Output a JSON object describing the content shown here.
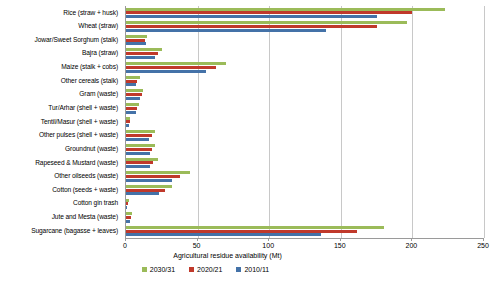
{
  "chart_data": {
    "type": "bar",
    "orientation": "horizontal",
    "title": "",
    "xlabel": "Agricultural residue availability (Mt)",
    "ylabel": "",
    "xlim": [
      0,
      250
    ],
    "xticks": [
      0,
      50,
      100,
      150,
      200,
      250
    ],
    "grid": true,
    "legend_position": "bottom",
    "categories": [
      "Rice (straw + husk)",
      "Wheat (straw)",
      "Jowar/Sweet Sorghum (stalk)",
      "Bajra (straw)",
      "Maize (stalk + cobs)",
      "Other cereals (stalk)",
      "Gram (waste)",
      "Tur/Arhar (shell + waste)",
      "Tentil/Masur (shell + waste)",
      "Other pulses (shell + waste)",
      "Groundnut (waste)",
      "Rapeseed & Mustard (waste)",
      "Other oilseeds (waste)",
      "Cotton (seeds + waste)",
      "Cotton gin trash",
      "Jute and Mesta (waste)",
      "Sugarcane (bagasse + leaves)"
    ],
    "series": [
      {
        "name": "2030/31",
        "color": "#9BBB59",
        "values": [
          223,
          196,
          15,
          25,
          70,
          10,
          12,
          9,
          3,
          20,
          20,
          22,
          45,
          32,
          2,
          4,
          180
        ]
      },
      {
        "name": "2020/21",
        "color": "#C0392B",
        "values": [
          200,
          175,
          13,
          22,
          63,
          8,
          11,
          8,
          2.5,
          18,
          18,
          19,
          38,
          27,
          1.5,
          3.5,
          161
        ]
      },
      {
        "name": "2010/11",
        "color": "#4472A8",
        "values": [
          175,
          140,
          14,
          20,
          56,
          7,
          10,
          7,
          2,
          16,
          17,
          17,
          32,
          23,
          1,
          3,
          136
        ]
      }
    ]
  },
  "legend": {
    "items": [
      {
        "label": "2030/31",
        "color": "#9BBB59"
      },
      {
        "label": "2020/21",
        "color": "#C0392B"
      },
      {
        "label": "2010/11",
        "color": "#4472A8"
      }
    ]
  }
}
